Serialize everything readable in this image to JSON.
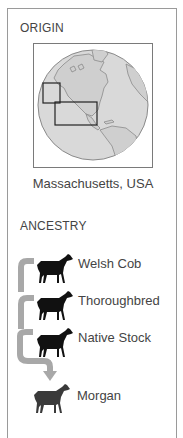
{
  "origin": {
    "heading": "ORIGIN",
    "map_icon": "globe-map",
    "caption": "Massachusetts, USA"
  },
  "ancestry": {
    "heading": "ANCESTRY",
    "items": [
      {
        "label": "Welsh Cob",
        "icon": "horse-silhouette"
      },
      {
        "label": "Thoroughbred",
        "icon": "horse-silhouette"
      },
      {
        "label": "Native Stock",
        "icon": "horse-silhouette"
      },
      {
        "label": "Morgan",
        "icon": "horse-silhouette"
      }
    ]
  },
  "colors": {
    "border": "#9a9a9a",
    "globe_fill": "#d6d6d6",
    "arrow": "#a8a8a8",
    "horse": "#111111",
    "horse_result": "#3a3a3a"
  }
}
